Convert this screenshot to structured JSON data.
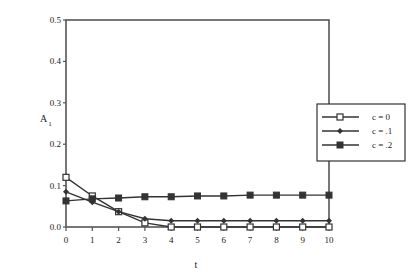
{
  "chart_data": {
    "type": "line",
    "title": "",
    "xlabel": "t",
    "ylabel": "A",
    "ylabel_subscript": "1",
    "xlim": [
      0,
      10
    ],
    "ylim": [
      0.0,
      0.5
    ],
    "x": [
      0,
      1,
      2,
      3,
      4,
      5,
      6,
      7,
      8,
      9,
      10
    ],
    "xticks": [
      "0",
      "1",
      "2",
      "3",
      "4",
      "5",
      "6",
      "7",
      "8",
      "9",
      "10"
    ],
    "yticks": [
      "0.0",
      "0.1",
      "0.2",
      "0.3",
      "0.4",
      "0.5"
    ],
    "grid": false,
    "legend_position": "right",
    "series": [
      {
        "name": "c = 0",
        "marker": "open-square",
        "values": [
          0.12,
          0.075,
          0.037,
          0.01,
          0.0,
          0.0,
          0.0,
          0.0,
          0.0,
          0.0,
          0.0
        ]
      },
      {
        "name": "c = .1",
        "marker": "filled-diamond",
        "values": [
          0.085,
          0.06,
          0.037,
          0.02,
          0.015,
          0.015,
          0.015,
          0.015,
          0.015,
          0.015,
          0.015
        ]
      },
      {
        "name": "c = .2",
        "marker": "filled-square",
        "values": [
          0.063,
          0.068,
          0.07,
          0.073,
          0.073,
          0.075,
          0.075,
          0.077,
          0.077,
          0.077,
          0.077
        ]
      }
    ]
  },
  "colors": {
    "line": "#333333",
    "axis": "#555555",
    "background": "#ffffff"
  }
}
